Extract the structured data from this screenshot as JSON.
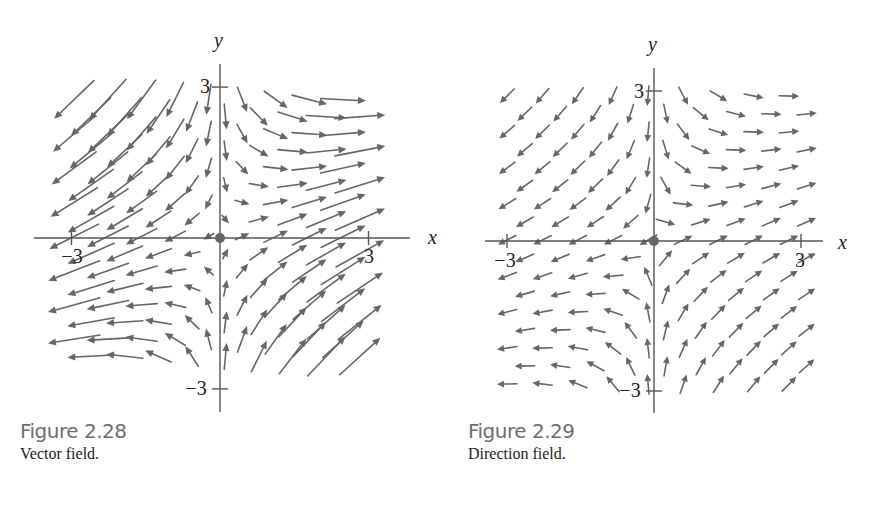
{
  "style": {
    "arrow_color": "#666666",
    "axis_color": "#555555",
    "origin_dot_color": "#666666",
    "caption_number_color": "#6e6e6e"
  },
  "figures": [
    {
      "id": "fig-2-28",
      "number_label": "Figure 2.28",
      "description": "Vector field.",
      "kind": "vector-field",
      "axes": {
        "origin_px": [
          220,
          238
        ],
        "unit_px": [
          49.5,
          50.3
        ],
        "x_axis_px": [
          34,
          410
        ],
        "y_axis_px": [
          64,
          412
        ],
        "x_label": "x",
        "y_label": "y",
        "x_label_px": [
          428,
          244
        ],
        "y_label_px": [
          214,
          47
        ],
        "ticks": {
          "x": [
            {
              "value": -3,
              "label": "−3",
              "label_px": [
                72,
                263
              ]
            },
            {
              "value": 3,
              "label": "3",
              "label_px": [
                369,
                263
              ]
            }
          ],
          "y": [
            {
              "value": 3,
              "label": "3",
              "label_px": [
                205,
                93
              ]
            },
            {
              "value": -3,
              "label": "−3",
              "label_px": [
                196,
                395
              ]
            }
          ]
        }
      },
      "field": {
        "formula": "F(x,y) = (x, (x - y)/2)",
        "fx": [
          1,
          0,
          0
        ],
        "fy": [
          0.5,
          -0.5,
          0
        ]
      },
      "grid": {
        "x_min": -2.95,
        "x_max": 3.1,
        "dx": 0.68,
        "y_min": -2.45,
        "y_max": 2.75,
        "dy": 0.34,
        "stagger": 0.34
      },
      "arrow": {
        "mode": "scaled",
        "scale_px": 20,
        "max_len_px": 55,
        "min_len_px": 10,
        "head_len": 8,
        "head_w": 3.6,
        "stroke": 1.6
      },
      "caption_px": [
        20,
        420
      ]
    },
    {
      "id": "fig-2-29",
      "number_label": "Figure 2.29",
      "description": "Direction field.",
      "kind": "direction-field",
      "axes": {
        "origin_px": [
          654,
          241
        ],
        "unit_px": [
          49,
          50
        ],
        "x_axis_px": [
          485,
          823
        ],
        "y_axis_px": [
          68,
          413
        ],
        "x_label": "x",
        "y_label": "y",
        "x_label_px": [
          838,
          249
        ],
        "y_label_px": [
          648,
          51
        ],
        "ticks": {
          "x": [
            {
              "value": -3,
              "label": "−3",
              "label_px": [
                505,
                267
              ]
            },
            {
              "value": 3,
              "label": "3",
              "label_px": [
                800,
                267
              ]
            }
          ],
          "y": [
            {
              "value": 3,
              "label": "3",
              "label_px": [
                639,
                98
              ]
            },
            {
              "value": -3,
              "label": "−3",
              "label_px": [
                630,
                397
              ]
            }
          ]
        }
      },
      "field": {
        "formula": "F(x,y) = (x, (x - y)/2)",
        "fx": [
          1,
          0,
          0
        ],
        "fy": [
          0.5,
          -0.5,
          0
        ]
      },
      "grid": {
        "x_min": -3.0,
        "x_max": 3.3,
        "dx": 0.72,
        "y_min": -2.95,
        "y_max": 2.9,
        "dy": 0.36,
        "stagger": 0.36
      },
      "arrow": {
        "mode": "unit",
        "len_px": 20,
        "head_len": 7,
        "head_w": 3.4,
        "stroke": 1.6
      },
      "caption_px": [
        468,
        420
      ]
    }
  ]
}
